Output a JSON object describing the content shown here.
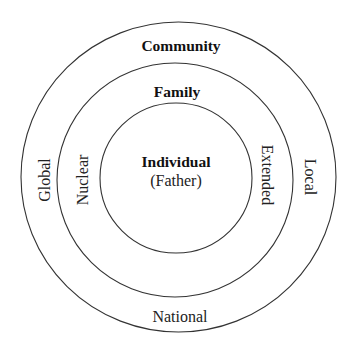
{
  "diagram": {
    "type": "concentric-circles",
    "stroke_color": "#333333",
    "background": "#ffffff",
    "rings": [
      {
        "name": "individual",
        "label": "Individual",
        "sublabel": "(Father)"
      },
      {
        "name": "family",
        "label": "Family",
        "left_label": "Nuclear",
        "right_label": "Extended"
      },
      {
        "name": "community",
        "label": "Community",
        "left_label": "Global",
        "right_label": "Local",
        "bottom_label": "National"
      }
    ]
  }
}
